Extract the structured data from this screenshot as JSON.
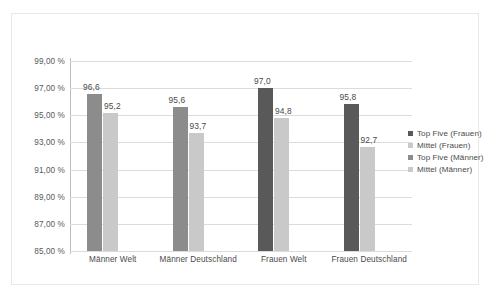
{
  "chart_data": {
    "type": "bar",
    "title": "",
    "subtitle": "",
    "xlabel": "",
    "ylabel": "",
    "ylim": [
      85,
      99
    ],
    "ytick_step": 2,
    "grid": "horizontal",
    "legend_position": "right",
    "categories": [
      "Männer Welt",
      "Männer Deutschland",
      "Frauen Welt",
      "Frauen Deutschland"
    ],
    "ytick_labels": [
      "99,00 %",
      "97,00 %",
      "95,00 %",
      "93,00 %",
      "91,00 %",
      "89,00 %",
      "87,00 %",
      "85,00 %"
    ],
    "ytick_values": [
      99,
      97,
      95,
      93,
      91,
      89,
      87,
      85
    ],
    "series": [
      {
        "name": "Top Five (Männer)",
        "color": "#8c8c8c",
        "values": [
          96.6,
          95.6,
          null,
          null
        ],
        "labels": [
          "96,6",
          "95,6",
          "",
          ""
        ]
      },
      {
        "name": "Mittel (Männer)",
        "color": "#c9c9c9",
        "values": [
          95.2,
          93.7,
          null,
          null
        ],
        "labels": [
          "95,2",
          "93,7",
          "",
          ""
        ]
      },
      {
        "name": "Top Five (Frauen)",
        "color": "#595959",
        "values": [
          null,
          null,
          97.0,
          95.8
        ],
        "labels": [
          "",
          "",
          "97,0",
          "95,8"
        ]
      },
      {
        "name": "Mittel (Frauen)",
        "color": "#c9c9c9",
        "values": [
          null,
          null,
          94.8,
          92.7
        ],
        "labels": [
          "",
          "",
          "94,8",
          "92,7"
        ]
      }
    ],
    "bars": [
      {
        "category": "Männer Welt",
        "series": "Top Five (Männer)",
        "value": 96.6,
        "label": "96,6",
        "color": "#8c8c8c"
      },
      {
        "category": "Männer Welt",
        "series": "Mittel (Männer)",
        "value": 95.2,
        "label": "95,2",
        "color": "#c9c9c9"
      },
      {
        "category": "Männer Deutschland",
        "series": "Top Five (Männer)",
        "value": 95.6,
        "label": "95,6",
        "color": "#8c8c8c"
      },
      {
        "category": "Männer Deutschland",
        "series": "Mittel (Männer)",
        "value": 93.7,
        "label": "93,7",
        "color": "#c9c9c9"
      },
      {
        "category": "Frauen Welt",
        "series": "Top Five (Frauen)",
        "value": 97.0,
        "label": "97,0",
        "color": "#595959"
      },
      {
        "category": "Frauen Welt",
        "series": "Mittel (Frauen)",
        "value": 94.8,
        "label": "94,8",
        "color": "#c9c9c9"
      },
      {
        "category": "Frauen Deutschland",
        "series": "Top Five (Frauen)",
        "value": 95.8,
        "label": "95,8",
        "color": "#595959"
      },
      {
        "category": "Frauen Deutschland",
        "series": "Mittel (Frauen)",
        "value": 92.7,
        "label": "92,7",
        "color": "#c9c9c9"
      }
    ],
    "legend": [
      {
        "label": "Top Five (Frauen)",
        "color": "#595959"
      },
      {
        "label": "Mittel (Frauen)",
        "color": "#c9c9c9"
      },
      {
        "label": "Top Five (Männer)",
        "color": "#8c8c8c"
      },
      {
        "label": "Mittel (Männer)",
        "color": "#c9c9c9"
      }
    ]
  },
  "colors": {
    "gridline": "#dcdcdc",
    "axis": "#bdbdbd",
    "frame": "#e8e8e8",
    "text": "#4a4a4a",
    "background": "#ffffff"
  }
}
